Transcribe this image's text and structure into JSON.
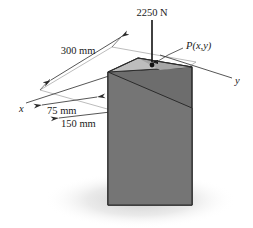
{
  "figure": {
    "background_color": "#ffffff"
  },
  "force": {
    "label": "2250 N",
    "arrow_name": "load-arrow",
    "direction": "down"
  },
  "point": {
    "label": "P(x,y)",
    "marker_name": "load-point-marker"
  },
  "dimensions": [
    {
      "label": "300 mm",
      "name": "dimension-300mm"
    },
    {
      "label": "75 mm",
      "name": "dimension-75mm"
    },
    {
      "label": "150 mm",
      "name": "dimension-150mm"
    }
  ],
  "axes": [
    {
      "label": "x",
      "name": "axis-label-x"
    },
    {
      "label": "y",
      "name": "axis-label-y"
    }
  ],
  "colors": {
    "top_face": "#b9b9b9",
    "top_face_shaded": "#a0a0a0",
    "front_left_face": "#737373",
    "front_right_face": "#6b6b6b",
    "outline": "#2b2b2b",
    "leader": "#3a3a3a",
    "shadow": "#d8d8d8"
  }
}
